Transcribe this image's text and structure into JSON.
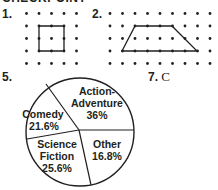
{
  "heading": "CHECKPOINT",
  "problems": [
    {
      "number": "1.",
      "type": "dot-grid",
      "shape": "square",
      "grid": {
        "cols": 5,
        "rows": 5
      },
      "vertices": [
        [
          1,
          1
        ],
        [
          3,
          1
        ],
        [
          3,
          3
        ],
        [
          1,
          3
        ]
      ]
    },
    {
      "number": "2.",
      "type": "dot-grid",
      "shape": "trapezoid",
      "grid": {
        "cols": 9,
        "rows": 5
      },
      "vertices": [
        [
          2,
          1
        ],
        [
          5,
          1
        ],
        [
          7,
          3
        ],
        [
          1,
          3
        ]
      ]
    },
    {
      "number": "5.",
      "type": "pie-chart"
    },
    {
      "number": "7.",
      "answer": "C"
    }
  ],
  "labels": {
    "p1": "1.",
    "p2": "2.",
    "p5": "5.",
    "p7_num": "7.",
    "p7_answer": "C"
  },
  "pie_labels": {
    "action_1": "Action-",
    "action_2": "Adventure",
    "action_pct": "36%",
    "comedy": "Comedy",
    "comedy_pct": "21.6%",
    "scifi_1": "Science",
    "scifi_2": "Fiction",
    "scifi_pct": "25.6%",
    "other": "Other",
    "other_pct": "16.8%"
  },
  "chart_data": {
    "type": "pie",
    "title": "",
    "categories": [
      "Action-Adventure",
      "Comedy",
      "Science Fiction",
      "Other"
    ],
    "values": [
      36,
      21.6,
      25.6,
      16.8
    ],
    "unit": "%",
    "legend": "none (labels inside slices)"
  }
}
